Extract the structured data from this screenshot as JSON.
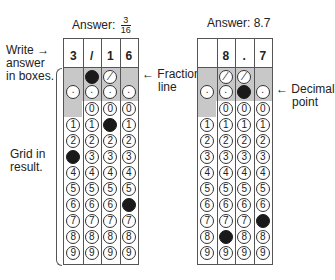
{
  "grid1": {
    "answer_label": "Answer:",
    "answer_num": "3",
    "answer_den": "16",
    "header": [
      "3",
      "/",
      "1",
      "6"
    ],
    "slash_row": [
      null,
      "filled",
      "/",
      null
    ],
    "dot_row": [
      ".",
      ".",
      ".",
      "."
    ],
    "digit_fills": [
      3,
      null,
      1,
      6
    ],
    "digits": [
      "0",
      "1",
      "2",
      "3",
      "4",
      "5",
      "6",
      "7",
      "8",
      "9"
    ]
  },
  "grid2": {
    "answer_label": "Answer: 8.7",
    "header": [
      "",
      "8",
      ".",
      "7"
    ],
    "slash_row": [
      null,
      "/",
      "/",
      null
    ],
    "dot_row": [
      ".",
      ".",
      "filled",
      "."
    ],
    "digit_fills": [
      null,
      8,
      null,
      7
    ],
    "digits": [
      "0",
      "1",
      "2",
      "3",
      "4",
      "5",
      "6",
      "7",
      "8",
      "9"
    ]
  },
  "labels": {
    "write_answer_1": "Write",
    "write_answer_2": "answer",
    "write_answer_3": "in boxes.",
    "fraction_line_1": "Fraction",
    "fraction_line_2": "line",
    "decimal_point_1": "Decimal",
    "decimal_point_2": "point",
    "grid_in_1": "Grid in",
    "grid_in_2": "result.",
    "arrow_right": "→",
    "arrow_left": "←"
  }
}
